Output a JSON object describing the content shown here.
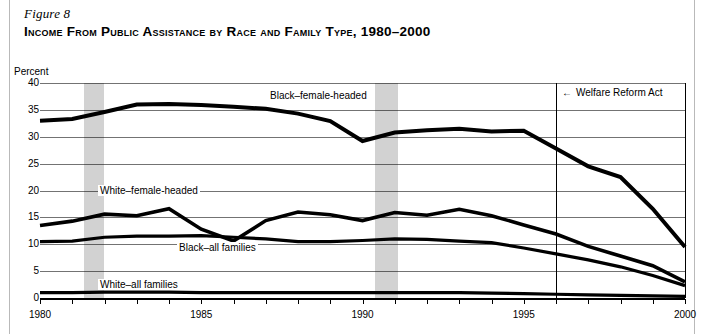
{
  "figure": {
    "number": "Figure 8",
    "title": "Income From Public Assistance by Race and Family Type, 1980–2000"
  },
  "chart_data": {
    "type": "line",
    "title": "Income From Public Assistance by Race and Family Type, 1980–2000",
    "xlabel": "",
    "ylabel": "Percent",
    "ylim": [
      0,
      40
    ],
    "xlim": [
      1980,
      2000
    ],
    "ytick_labels": [
      "0",
      "5",
      "10",
      "15",
      "20",
      "25",
      "30",
      "35",
      "40"
    ],
    "ytick_values": [
      0,
      5,
      10,
      15,
      20,
      25,
      30,
      35,
      40
    ],
    "xtick_labels": [
      "1980",
      "1985",
      "1990",
      "1995",
      "2000"
    ],
    "xtick_values": [
      1980,
      1985,
      1990,
      1995,
      2000
    ],
    "grid": true,
    "legend_position": "inline-labels",
    "x": [
      1980,
      1981,
      1982,
      1983,
      1984,
      1985,
      1986,
      1987,
      1988,
      1989,
      1990,
      1991,
      1992,
      1993,
      1994,
      1995,
      1996,
      1997,
      1998,
      1999,
      2000
    ],
    "series": [
      {
        "name": "Black–female-headed",
        "label": "Black–female-headed",
        "values": [
          33.0,
          33.4,
          34.6,
          36.0,
          36.2,
          36.0,
          35.7,
          36.2,
          36.5,
          35.7,
          34.5,
          33.4,
          32.0,
          31.0,
          31.1,
          31.0,
          28.0,
          25.5,
          24.0,
          21.0,
          20.0
        ]
      },
      {
        "name": "White–female-headed",
        "label": "White–female-headed",
        "values": [
          13.5,
          14.2,
          15.0,
          16.4,
          10.5,
          15.2,
          16.0,
          15.6,
          15.0,
          15.3,
          14.0,
          12.0,
          15.3,
          16.0,
          15.4,
          14.8,
          14.9,
          15.6,
          14.0,
          13.2,
          12.0
        ]
      },
      {
        "name": "Black–all families",
        "label": "Black–all families",
        "values": [
          10.4,
          10.5,
          10.7,
          11.0,
          11.2,
          11.5,
          11.5,
          11.3,
          11.2,
          10.8,
          10.6,
          10.6,
          10.5,
          10.4,
          10.2,
          10.4,
          10.6,
          10.6,
          10.4,
          10.2,
          9.8
        ]
      },
      {
        "name": "White–all families",
        "label": "White–all families",
        "values": [
          1.0,
          1.0,
          1.0,
          1.0,
          1.0,
          1.0,
          1.0,
          1.0,
          1.0,
          1.0,
          1.0,
          1.0,
          1.0,
          1.0,
          1.0,
          1.0,
          1.0,
          0.9,
          0.8,
          0.7,
          0.6
        ]
      }
    ],
    "series_paths": {
      "black_female_headed": [
        [
          1980,
          33.0
        ],
        [
          1981,
          33.3
        ],
        [
          1982,
          34.6
        ],
        [
          1983,
          36.0
        ],
        [
          1984,
          36.1
        ],
        [
          1985,
          35.9
        ],
        [
          1986,
          35.6
        ],
        [
          1987,
          35.2
        ],
        [
          1988,
          34.3
        ],
        [
          1989,
          32.9
        ],
        [
          1990,
          29.2
        ],
        [
          1991,
          30.8
        ],
        [
          1992,
          31.2
        ],
        [
          1993,
          31.5
        ],
        [
          1994,
          31.0
        ],
        [
          1995,
          31.1
        ],
        [
          1996,
          27.8
        ],
        [
          1997,
          24.5
        ],
        [
          1998,
          22.5
        ],
        [
          1999,
          16.6
        ],
        [
          2000,
          9.5
        ]
      ],
      "white_female_headed": [
        [
          1980,
          13.5
        ],
        [
          1981,
          14.3
        ],
        [
          1982,
          15.6
        ],
        [
          1983,
          15.3
        ],
        [
          1984,
          16.6
        ],
        [
          1985,
          12.8
        ],
        [
          1986,
          10.6
        ],
        [
          1987,
          14.4
        ],
        [
          1988,
          16.0
        ],
        [
          1989,
          15.5
        ],
        [
          1990,
          14.4
        ],
        [
          1991,
          15.9
        ],
        [
          1992,
          15.4
        ],
        [
          1993,
          16.5
        ],
        [
          1994,
          15.3
        ],
        [
          1995,
          13.6
        ],
        [
          1996,
          11.9
        ],
        [
          1997,
          9.6
        ],
        [
          1998,
          7.8
        ],
        [
          1999,
          6.0
        ],
        [
          2000,
          3.0
        ]
      ],
      "black_all_families": [
        [
          1980,
          10.5
        ],
        [
          1981,
          10.6
        ],
        [
          1982,
          11.3
        ],
        [
          1983,
          11.5
        ],
        [
          1984,
          11.5
        ],
        [
          1985,
          11.6
        ],
        [
          1986,
          11.3
        ],
        [
          1987,
          11.0
        ],
        [
          1988,
          10.5
        ],
        [
          1989,
          10.5
        ],
        [
          1990,
          10.7
        ],
        [
          1991,
          11.0
        ],
        [
          1992,
          10.9
        ],
        [
          1993,
          10.6
        ],
        [
          1994,
          10.3
        ],
        [
          1995,
          9.3
        ],
        [
          1996,
          8.2
        ],
        [
          1997,
          7.1
        ],
        [
          1998,
          5.8
        ],
        [
          1999,
          4.2
        ],
        [
          2000,
          2.3
        ]
      ],
      "white_all_families": [
        [
          1980,
          1.0
        ],
        [
          1981,
          1.0
        ],
        [
          1982,
          1.1
        ],
        [
          1983,
          1.1
        ],
        [
          1984,
          1.1
        ],
        [
          1985,
          1.0
        ],
        [
          1986,
          1.0
        ],
        [
          1987,
          1.0
        ],
        [
          1988,
          1.0
        ],
        [
          1989,
          1.0
        ],
        [
          1990,
          1.0
        ],
        [
          1991,
          1.0
        ],
        [
          1992,
          1.0
        ],
        [
          1993,
          1.0
        ],
        [
          1994,
          0.9
        ],
        [
          1995,
          0.8
        ],
        [
          1996,
          0.7
        ],
        [
          1997,
          0.6
        ],
        [
          1998,
          0.5
        ],
        [
          1999,
          0.4
        ],
        [
          2000,
          0.3
        ]
      ]
    },
    "recession_bands": [
      {
        "start": 1981.35,
        "end": 1982.0
      },
      {
        "start": 1990.4,
        "end": 1991.1
      }
    ],
    "event_line": {
      "x": 1996.0,
      "label": "Welfare Reform Act",
      "arrow": "←"
    }
  }
}
